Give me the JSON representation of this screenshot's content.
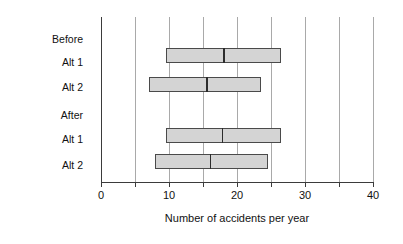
{
  "chart_data": {
    "type": "bar",
    "subtype": "horizontal-range-box",
    "title": "",
    "xlabel": "Number of accidents per year",
    "ylabel": "",
    "xlim": [
      0,
      40
    ],
    "xticks": [
      0,
      5,
      10,
      15,
      20,
      25,
      30,
      35,
      40
    ],
    "xtick_labels": [
      "0",
      "",
      "10",
      "",
      "20",
      "",
      "30",
      "",
      "40"
    ],
    "grid": true,
    "legend": "none",
    "groups": [
      {
        "name": "Before",
        "categories": [
          {
            "label": "Alt 1",
            "low": 9.5,
            "median": 18.0,
            "high": 26.5
          },
          {
            "label": "Alt 2",
            "low": 7.0,
            "median": 15.5,
            "high": 23.5
          }
        ]
      },
      {
        "name": "After",
        "categories": [
          {
            "label": "Alt 1",
            "low": 9.5,
            "median": 17.8,
            "high": 26.5
          },
          {
            "label": "Alt 2",
            "low": 8.0,
            "median": 16.0,
            "high": 24.5
          }
        ]
      }
    ],
    "colors": {
      "box_fill": "#d4d4d4",
      "box_border": "#4a4a4a",
      "median_line": "#2c2c2c",
      "gridline": "#a9a9a9",
      "axis": "#3b3b3b",
      "text": "#111111",
      "background": "#ffffff"
    }
  },
  "labels": {
    "group_before": "Before",
    "group_after": "After",
    "before_alt1": "Alt 1",
    "before_alt2": "Alt 2",
    "after_alt1": "Alt 1",
    "after_alt2": "Alt 2"
  },
  "axis": {
    "title": "Number of accidents per year",
    "tick_0": "0",
    "tick_10": "10",
    "tick_20": "20",
    "tick_30": "30",
    "tick_40": "40"
  }
}
